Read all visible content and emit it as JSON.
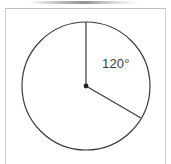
{
  "figure": {
    "name": "circle-central-angle-diagram",
    "background_color": "#ffffff",
    "frame": {
      "border_color": "#cfcfcf",
      "left": 5,
      "top": 8,
      "width": 161,
      "height": 160
    },
    "circle": {
      "center_x": 86,
      "center_y": 86,
      "radius": 64,
      "stroke_color": "#3c3c3c",
      "stroke_width": 1.2,
      "fill": "none"
    },
    "center_point": {
      "label": "center-dot",
      "radius": 2.4,
      "color": "#222222"
    },
    "radii": [
      {
        "name": "radius-vertical-up",
        "angle_degrees_from_12oclock": 0,
        "end_x": 86,
        "end_y": 22,
        "stroke_color": "#3c3c3c"
      },
      {
        "name": "radius-lower-right",
        "angle_degrees_from_12oclock": 120,
        "end_x": 141,
        "end_y": 118,
        "stroke_color": "#3c3c3c"
      }
    ],
    "angle_label": {
      "text": "120°",
      "value": 120,
      "unit": "degrees",
      "color": "#3a3a3a",
      "x": 102,
      "y": 56
    },
    "top_smudge": {
      "name": "top-shadow-artifact",
      "color": "#8f8f8f"
    }
  }
}
